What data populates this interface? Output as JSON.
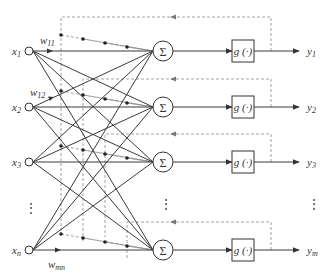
{
  "diagram": {
    "title": "",
    "colors": {
      "line": "#3a3a3a",
      "feedback": "#8a8a8a",
      "background": "#ffffff"
    },
    "inputs": [
      {
        "id": "x1",
        "label": "x",
        "sub": "1",
        "y": 51
      },
      {
        "id": "x2",
        "label": "x",
        "sub": "2",
        "y": 107
      },
      {
        "id": "x3",
        "label": "x",
        "sub": "3",
        "y": 162
      },
      {
        "id": "xn",
        "label": "x",
        "sub": "n",
        "y": 250
      }
    ],
    "input_ellipsis": "⋮",
    "weights": [
      {
        "id": "w11",
        "label": "w",
        "sub": "11"
      },
      {
        "id": "w12",
        "label": "w",
        "sub": "12"
      },
      {
        "id": "wmn",
        "label": "w",
        "sub": "mn"
      }
    ],
    "neurons": [
      {
        "id": "n1",
        "sum_symbol": "Σ",
        "activation": "g (·)",
        "output_label": "y",
        "output_sub": "1",
        "y": 51,
        "feedback_y": 17
      },
      {
        "id": "n2",
        "sum_symbol": "Σ",
        "activation": "g (·)",
        "output_label": "y",
        "output_sub": "2",
        "y": 107,
        "feedback_y": 79
      },
      {
        "id": "n3",
        "sum_symbol": "Σ",
        "activation": "g (·)",
        "output_label": "y",
        "output_sub": "3",
        "y": 162,
        "feedback_y": 134
      },
      {
        "id": "nm",
        "sum_symbol": "Σ",
        "activation": "g (·)",
        "output_label": "y",
        "output_sub": "m",
        "y": 250,
        "feedback_y": 222
      }
    ],
    "neuron_ellipsis": "⋮",
    "output_ellipsis": "⋮"
  }
}
